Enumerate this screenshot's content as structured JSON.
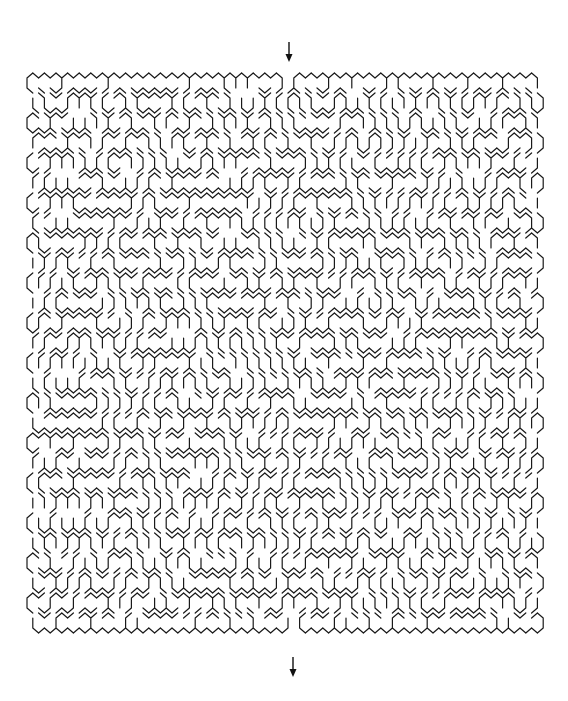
{
  "puzzle": {
    "type": "hexagonal-maze",
    "bounds": {
      "left": 27,
      "top": 73,
      "right": 540,
      "bottom": 646
    },
    "cell_width": 11.6,
    "row_height": 10.0,
    "seed": 90817,
    "wall_color": "#1a1a1a",
    "background": "#ffffff"
  },
  "entrance": {
    "icon": "down-arrow-icon",
    "x": 289,
    "y_start": 42,
    "y_end": 62,
    "gap_x": 289
  },
  "exit": {
    "icon": "down-arrow-icon",
    "x": 293,
    "y_start": 657,
    "y_end": 677,
    "gap_x": 293
  }
}
